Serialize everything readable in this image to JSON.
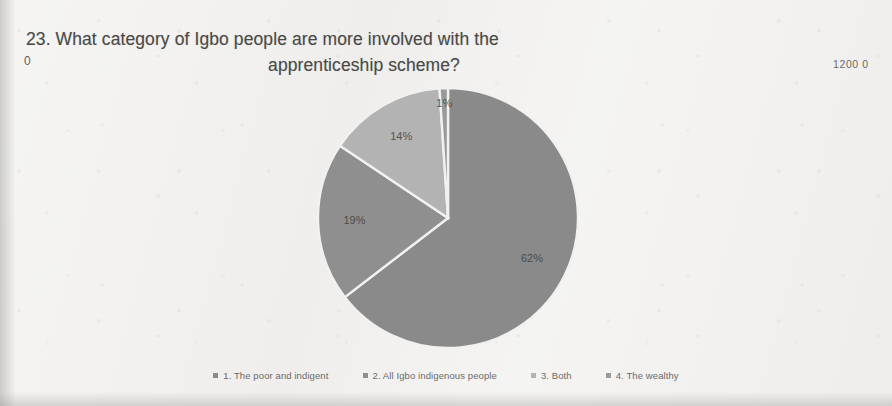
{
  "document": {
    "title_line_1": "23. What category of Igbo people are more involved with the",
    "title_line_2": "apprenticeship scheme?",
    "stray_marks": {
      "left": "0",
      "right": "1200 0"
    }
  },
  "colors": {
    "page_background": "#f2f1ef",
    "slice_1": "#8a8a8a",
    "slice_2": "#8f8f8f",
    "slice_3": "#b3b3b3",
    "slice_4": "#9a9a9a",
    "label_text": "#3f3f3e",
    "title_text": "#4a4a48",
    "legend_text": "#5b5b59"
  },
  "chart_data": {
    "type": "pie",
    "title": "23. What category of Igbo people are more involved with the apprenticeship scheme?",
    "categories": [
      "1. The poor and indigent",
      "2. All Igbo indigenous people",
      "3. Both",
      "4. The wealthy"
    ],
    "values": [
      62,
      19,
      14,
      1
    ],
    "data_labels": [
      "62%",
      "19%",
      "14%",
      "1%"
    ],
    "colors": [
      "#8a8a8a",
      "#8f8f8f",
      "#b3b3b3",
      "#9a9a9a"
    ],
    "legend_position": "bottom",
    "start_angle_deg": 0,
    "direction": "clockwise",
    "grid": false
  },
  "legend": {
    "items": [
      {
        "label": "1. The poor and indigent",
        "color": "#8a8a8a"
      },
      {
        "label": "2. All Igbo indigenous people",
        "color": "#8f8f8f"
      },
      {
        "label": "3. Both",
        "color": "#b3b3b3"
      },
      {
        "label": "4. The wealthy",
        "color": "#9a9a9a"
      }
    ]
  }
}
